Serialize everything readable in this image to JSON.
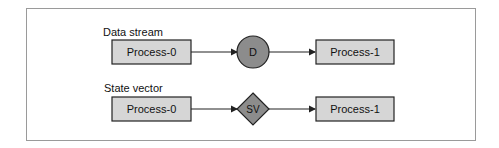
{
  "diagram": {
    "rows": [
      {
        "label": "Data stream",
        "source": "Process-0",
        "connector": {
          "shape": "circle",
          "text": "D"
        },
        "target": "Process-1"
      },
      {
        "label": "State vector",
        "source": "Process-0",
        "connector": {
          "shape": "diamond",
          "text": "SV"
        },
        "target": "Process-1"
      }
    ],
    "colors": {
      "box_fill": "#d6d6d6",
      "connector_fill": "#8c8c8c",
      "stroke": "#222222",
      "frame": "#9a9a9a"
    }
  }
}
